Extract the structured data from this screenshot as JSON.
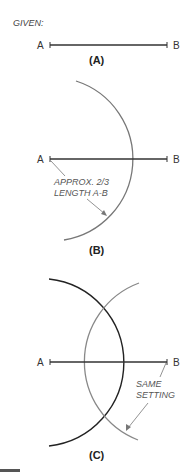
{
  "title": "GIVEN:",
  "colors": {
    "line": "#333333",
    "arc_primary": "#777777",
    "arc_dark": "#222222",
    "arc_secondary": "#888888",
    "leader": "#777777",
    "footer_bar": "#555555"
  },
  "panels": [
    {
      "id": "A",
      "caption": "(A)",
      "point_a": "A",
      "point_b": "B"
    },
    {
      "id": "B",
      "caption": "(B)",
      "point_a": "A",
      "point_b": "B",
      "note_line1": "APPROX. 2/3",
      "note_line2": "LENGTH A-B"
    },
    {
      "id": "C",
      "caption": "(C)",
      "point_a": "A",
      "point_b": "B",
      "note_line1": "SAME",
      "note_line2": "SETTING"
    }
  ]
}
